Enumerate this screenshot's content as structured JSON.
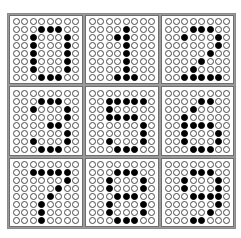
{
  "grid": {
    "rows": 3,
    "cols": 3,
    "dot_rows": 8,
    "dot_cols": 8,
    "colors": {
      "on": "#000000",
      "off": "#ffffff",
      "outline": "#4a4a4a",
      "divider": "#9a9a9a"
    }
  },
  "digits": [
    {
      "label": "0",
      "on": [
        [
          1,
          3
        ],
        [
          1,
          4
        ],
        [
          1,
          5
        ],
        [
          2,
          2
        ],
        [
          2,
          6
        ],
        [
          3,
          2
        ],
        [
          3,
          6
        ],
        [
          4,
          2
        ],
        [
          4,
          6
        ],
        [
          5,
          2
        ],
        [
          5,
          6
        ],
        [
          6,
          2
        ],
        [
          6,
          6
        ],
        [
          7,
          3
        ],
        [
          7,
          4
        ],
        [
          7,
          5
        ]
      ]
    },
    {
      "label": "1",
      "on": [
        [
          1,
          4
        ],
        [
          2,
          3
        ],
        [
          2,
          4
        ],
        [
          3,
          4
        ],
        [
          4,
          4
        ],
        [
          5,
          4
        ],
        [
          6,
          4
        ],
        [
          7,
          3
        ],
        [
          7,
          4
        ],
        [
          7,
          5
        ]
      ]
    },
    {
      "label": "2",
      "on": [
        [
          1,
          3
        ],
        [
          1,
          4
        ],
        [
          1,
          5
        ],
        [
          2,
          2
        ],
        [
          2,
          6
        ],
        [
          3,
          6
        ],
        [
          4,
          5
        ],
        [
          5,
          4
        ],
        [
          6,
          3
        ],
        [
          7,
          2
        ],
        [
          7,
          3
        ],
        [
          7,
          4
        ],
        [
          7,
          5
        ],
        [
          7,
          6
        ]
      ]
    },
    {
      "label": "3",
      "on": [
        [
          1,
          3
        ],
        [
          1,
          4
        ],
        [
          1,
          5
        ],
        [
          2,
          2
        ],
        [
          2,
          6
        ],
        [
          3,
          6
        ],
        [
          4,
          4
        ],
        [
          4,
          5
        ],
        [
          5,
          6
        ],
        [
          6,
          2
        ],
        [
          6,
          6
        ],
        [
          7,
          3
        ],
        [
          7,
          4
        ],
        [
          7,
          5
        ]
      ]
    },
    {
      "label": "5",
      "on": [
        [
          1,
          2
        ],
        [
          1,
          3
        ],
        [
          1,
          4
        ],
        [
          1,
          5
        ],
        [
          1,
          6
        ],
        [
          2,
          2
        ],
        [
          3,
          2
        ],
        [
          3,
          3
        ],
        [
          3,
          4
        ],
        [
          3,
          5
        ],
        [
          4,
          6
        ],
        [
          5,
          6
        ],
        [
          6,
          2
        ],
        [
          6,
          6
        ],
        [
          7,
          3
        ],
        [
          7,
          4
        ],
        [
          7,
          5
        ]
      ]
    },
    {
      "label": "6",
      "on": [
        [
          1,
          4
        ],
        [
          1,
          5
        ],
        [
          2,
          3
        ],
        [
          3,
          2
        ],
        [
          4,
          2
        ],
        [
          4,
          3
        ],
        [
          4,
          4
        ],
        [
          4,
          5
        ],
        [
          5,
          2
        ],
        [
          5,
          6
        ],
        [
          6,
          2
        ],
        [
          6,
          6
        ],
        [
          7,
          3
        ],
        [
          7,
          4
        ],
        [
          7,
          5
        ]
      ]
    },
    {
      "label": "7",
      "on": [
        [
          1,
          2
        ],
        [
          1,
          3
        ],
        [
          1,
          4
        ],
        [
          1,
          5
        ],
        [
          1,
          6
        ],
        [
          2,
          6
        ],
        [
          3,
          5
        ],
        [
          4,
          4
        ],
        [
          5,
          3
        ],
        [
          6,
          3
        ],
        [
          7,
          3
        ]
      ]
    },
    {
      "label": "8",
      "on": [
        [
          1,
          3
        ],
        [
          1,
          4
        ],
        [
          1,
          5
        ],
        [
          2,
          2
        ],
        [
          2,
          6
        ],
        [
          3,
          2
        ],
        [
          3,
          6
        ],
        [
          4,
          3
        ],
        [
          4,
          4
        ],
        [
          4,
          5
        ],
        [
          5,
          2
        ],
        [
          5,
          6
        ],
        [
          6,
          2
        ],
        [
          6,
          6
        ],
        [
          7,
          3
        ],
        [
          7,
          4
        ],
        [
          7,
          5
        ]
      ]
    },
    {
      "label": "9",
      "on": [
        [
          1,
          3
        ],
        [
          1,
          4
        ],
        [
          1,
          5
        ],
        [
          2,
          2
        ],
        [
          2,
          6
        ],
        [
          3,
          2
        ],
        [
          3,
          6
        ],
        [
          4,
          3
        ],
        [
          4,
          4
        ],
        [
          4,
          5
        ],
        [
          4,
          6
        ],
        [
          5,
          6
        ],
        [
          6,
          5
        ],
        [
          7,
          3
        ],
        [
          7,
          4
        ]
      ]
    }
  ]
}
